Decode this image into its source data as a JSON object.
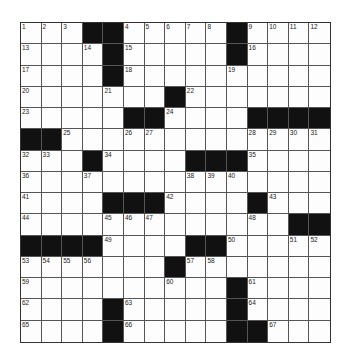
{
  "puzzle": {
    "rows": 15,
    "cols": 15,
    "colors": {
      "block": "#111111",
      "cell": "#fdfdfd",
      "line": "#555555"
    },
    "grid": [
      [
        "1",
        "2",
        "3",
        "#",
        "#",
        "4",
        "5",
        "6",
        "7",
        "8",
        "#",
        "9",
        "10",
        "11",
        "12"
      ],
      [
        "13",
        "",
        "",
        "14",
        "#",
        "15",
        "",
        "",
        "",
        "",
        "#",
        "16",
        "",
        "",
        ""
      ],
      [
        "17",
        "",
        "",
        "",
        "#",
        "18",
        "",
        "",
        "",
        "",
        "19",
        "",
        "",
        "",
        ""
      ],
      [
        "20",
        "",
        "",
        "",
        "21",
        "",
        "",
        "#",
        "22",
        "",
        "",
        "",
        "",
        "",
        ""
      ],
      [
        "23",
        "",
        "",
        "",
        "",
        "#",
        "#",
        "24",
        "",
        "",
        "",
        "#",
        "#",
        "#",
        "#"
      ],
      [
        "#",
        "#",
        "25",
        "",
        "",
        "26",
        "27",
        "",
        "",
        "",
        "",
        "28",
        "29",
        "30",
        "31"
      ],
      [
        "32",
        "33",
        "",
        "#",
        "34",
        "",
        "",
        "",
        "#",
        "#",
        "#",
        "35",
        "",
        "",
        ""
      ],
      [
        "36",
        "",
        "",
        "37",
        "",
        "",
        "",
        "",
        "38",
        "39",
        "40",
        "",
        "",
        "",
        ""
      ],
      [
        "41",
        "",
        "",
        "",
        "#",
        "#",
        "#",
        "42",
        "",
        "",
        "",
        "#",
        "43",
        "",
        ""
      ],
      [
        "44",
        "",
        "",
        "",
        "45",
        "46",
        "47",
        "",
        "",
        "",
        "",
        "48",
        "",
        "#",
        "#"
      ],
      [
        "#",
        "#",
        "#",
        "#",
        "49",
        "",
        "",
        "",
        "#",
        "#",
        "50",
        "",
        "",
        "51",
        "52"
      ],
      [
        "53",
        "54",
        "55",
        "56",
        "",
        "",
        "",
        "#",
        "57",
        "58",
        "",
        "",
        "",
        "",
        ""
      ],
      [
        "59",
        "",
        "",
        "",
        "",
        "",
        "",
        "60",
        "",
        "",
        "#",
        "61",
        "",
        "",
        ""
      ],
      [
        "62",
        "",
        "",
        "",
        "#",
        "63",
        "",
        "",
        "",
        "",
        "#",
        "64",
        "",
        "",
        ""
      ],
      [
        "65",
        "",
        "",
        "",
        "#",
        "66",
        "",
        "",
        "",
        "",
        "#",
        "#",
        "67",
        "",
        ""
      ]
    ]
  }
}
